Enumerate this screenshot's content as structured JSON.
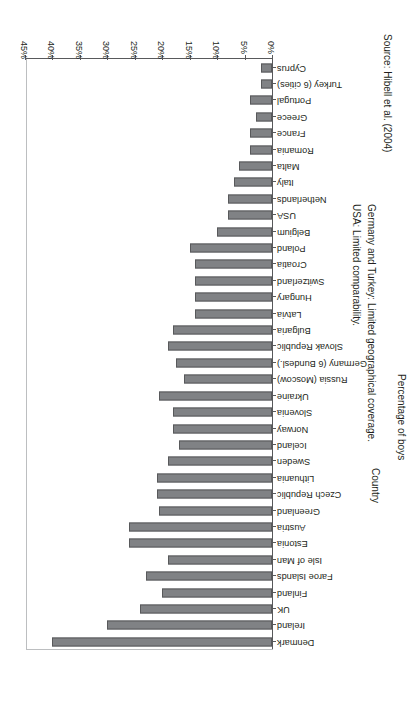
{
  "chart_data": {
    "type": "bar",
    "orientation": "horizontal",
    "title": "",
    "xlabel": "Percentage of boys",
    "ylabel": "Country",
    "xlim": [
      0,
      45
    ],
    "xtick_labels": [
      "0%",
      "5%",
      "10%",
      "15%",
      "20%",
      "25%",
      "30%",
      "35%",
      "40%",
      "45%"
    ],
    "xtick_values": [
      0,
      5,
      10,
      15,
      20,
      25,
      30,
      35,
      40,
      45
    ],
    "grid": false,
    "legend": false,
    "unit": "%",
    "categories": [
      "Denmark",
      "Ireland",
      "UK",
      "Finland",
      "Faroe Islands",
      "Isle of Man",
      "Estonia",
      "Austria",
      "Greenland",
      "Czech Republic",
      "Lithuania",
      "Sweden",
      "Iceland",
      "Norway",
      "Slovenia",
      "Ukraine",
      "Russia (Moscow)",
      "Germany (6 Bundesl.)",
      "Slovak Republic",
      "Bulgaria",
      "Latvia",
      "Hungary",
      "Switzerland",
      "Croatia",
      "Poland",
      "Belgium",
      "USA",
      "Netherlands",
      "Italy",
      "Malta",
      "Romania",
      "France",
      "Greece",
      "Portugal",
      "Turkey (6 cities)",
      "Cyprus"
    ],
    "values": [
      40,
      30,
      24,
      20,
      23,
      19,
      26,
      26,
      20.5,
      21,
      21,
      19,
      17,
      18,
      18,
      20.5,
      16,
      17.5,
      19,
      18,
      14,
      14,
      14,
      14,
      15,
      10,
      8,
      8,
      7,
      6,
      4,
      4,
      3,
      4,
      2,
      2
    ],
    "bar_color": "#808285",
    "bar_edge_color": "#58595b"
  },
  "notes": {
    "source": "Source: Hibell et al. (2004)",
    "note_a": "Germany and Turkey: Limited geographical coverage.",
    "note_b": "USA: Limited comparability."
  }
}
